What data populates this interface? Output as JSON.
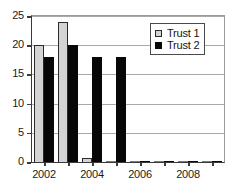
{
  "chart_data": {
    "type": "bar",
    "title": "",
    "subtitle": "",
    "xlabel": "",
    "ylabel": "",
    "categories": [
      "2002",
      "2003",
      "2004",
      "2005",
      "2006",
      "2007",
      "2008",
      "2009"
    ],
    "series": [
      {
        "name": "Trust 1",
        "color": "#d4d4d4",
        "values": [
          20,
          24,
          0.7,
          0,
          0,
          0,
          0,
          0
        ]
      },
      {
        "name": "Trust 2",
        "color": "#070707",
        "values": [
          18,
          20,
          18,
          18,
          0,
          0,
          0,
          0
        ]
      }
    ],
    "ylim": [
      0,
      25
    ],
    "y_ticks": [
      "0",
      "5",
      "10",
      "15",
      "20",
      "25"
    ],
    "y_tick_values": [
      0,
      5,
      10,
      15,
      20,
      25
    ],
    "x_tick_labels": [
      "2002",
      "2004",
      "2006",
      "2008"
    ],
    "x_tick_categories": [
      0,
      2,
      4,
      6
    ],
    "grid": true,
    "grid_axis": "y",
    "legend": {
      "position": "top-right",
      "border": true,
      "entries": [
        {
          "label": "Trust 1",
          "swatch": "light-gray-square"
        },
        {
          "label": "Trust 2",
          "swatch": "black-square"
        }
      ]
    }
  }
}
